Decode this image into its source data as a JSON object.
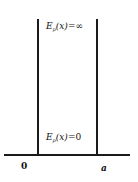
{
  "diagram": {
    "type": "infinite-square-well",
    "top_label": {
      "symbol": "E",
      "subscript": "p",
      "argument": "(x)=",
      "value": "∞"
    },
    "bottom_label": {
      "symbol": "E",
      "subscript": "p",
      "argument": "(x)=",
      "value": "0"
    },
    "axis_ticks": {
      "left": "0",
      "right": "a"
    },
    "colors": {
      "line": "#1a1a1a",
      "background": "#ffffff"
    }
  }
}
